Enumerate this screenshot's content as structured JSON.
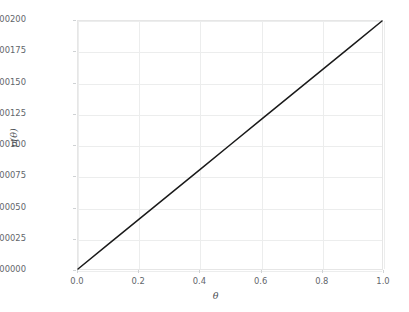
{
  "top_caption_fragment": "partially cropped text line",
  "chart_data": {
    "type": "line",
    "title": "",
    "xlabel": "θ",
    "ylabel": "p(θ)",
    "xlim": [
      0.0,
      1.0
    ],
    "ylim": [
      0.0,
      0.002
    ],
    "grid": true,
    "legend": null,
    "x_ticks": [
      "0.0",
      "0.2",
      "0.4",
      "0.6",
      "0.8",
      "1.0"
    ],
    "x_tick_values": [
      0.0,
      0.2,
      0.4,
      0.6,
      0.8,
      1.0
    ],
    "y_ticks": [
      "0.00000",
      "0.00025",
      "0.00050",
      "0.00075",
      "0.00100",
      "0.00125",
      "0.00150",
      "0.00175",
      "0.00200"
    ],
    "y_tick_values": [
      0.0,
      0.00025,
      0.0005,
      0.00075,
      0.001,
      0.00125,
      0.0015,
      0.00175,
      0.002
    ],
    "series": [
      {
        "name": "p(θ)",
        "color": "#1a1a1a",
        "linewidth": 1.5,
        "x": [
          0.0,
          0.1,
          0.2,
          0.3,
          0.4,
          0.5,
          0.6,
          0.7,
          0.8,
          0.9,
          1.0
        ],
        "values": [
          0.0,
          0.0002,
          0.0004,
          0.0006,
          0.0008,
          0.001,
          0.0012,
          0.0014,
          0.0016,
          0.0018,
          0.002
        ]
      }
    ],
    "style": {
      "background": "#ffffff",
      "grid_color": "#eceded",
      "axis_color": "#e6e6e6",
      "tick_label_color": "#62666b",
      "axis_label_color": "#4d5155"
    }
  }
}
